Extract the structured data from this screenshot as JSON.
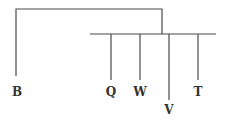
{
  "diagram": {
    "type": "tree",
    "colors": {
      "line": "#4a4a4a",
      "text": "#333333",
      "background": "#ffffff"
    },
    "root_bracket": {
      "left_x": 16,
      "right_x": 162,
      "top_y": 9
    },
    "bar": {
      "x1": 90,
      "x2": 216,
      "y": 34
    },
    "leaves": [
      {
        "id": "B",
        "label": "B",
        "x": 16,
        "line_top": 9,
        "line_bottom": 76,
        "label_y": 95
      },
      {
        "id": "Q",
        "label": "Q",
        "x": 111,
        "line_top": 34,
        "line_bottom": 80,
        "label_y": 95
      },
      {
        "id": "W",
        "label": "W",
        "x": 140,
        "line_top": 34,
        "line_bottom": 80,
        "label_y": 95
      },
      {
        "id": "V",
        "label": "V",
        "x": 169,
        "line_top": 34,
        "line_bottom": 100,
        "label_y": 113
      },
      {
        "id": "T",
        "label": "T",
        "x": 198,
        "line_top": 34,
        "line_bottom": 80,
        "label_y": 95
      }
    ]
  }
}
